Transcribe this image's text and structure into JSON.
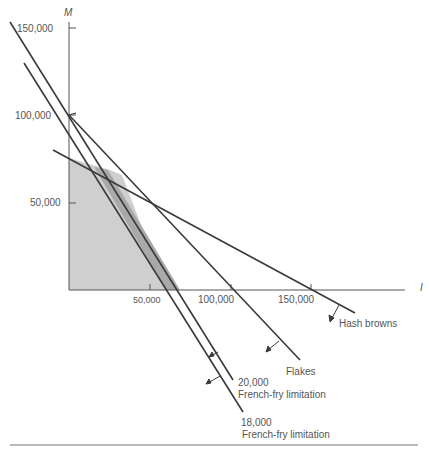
{
  "diagram": {
    "y_axis": {
      "name": "M",
      "ticks": [
        "150,000",
        "100,000",
        "50,000"
      ]
    },
    "x_axis": {
      "name": "I",
      "ticks": [
        "50,000",
        "100,000",
        "150,000"
      ]
    },
    "constraints": [
      {
        "id": "hash-browns",
        "label": "Hash browns"
      },
      {
        "id": "flakes",
        "label": "Flakes"
      },
      {
        "id": "ff-20000",
        "value": "20,000",
        "label": "French-fry limitation"
      },
      {
        "id": "ff-18000",
        "value": "18,000",
        "label": "French-fry limitation"
      }
    ],
    "colors": {
      "line": "#3a3a3a",
      "feasible_region": "#cfcfcf",
      "added_region": "#a9a9a9",
      "text": "#555555"
    }
  }
}
